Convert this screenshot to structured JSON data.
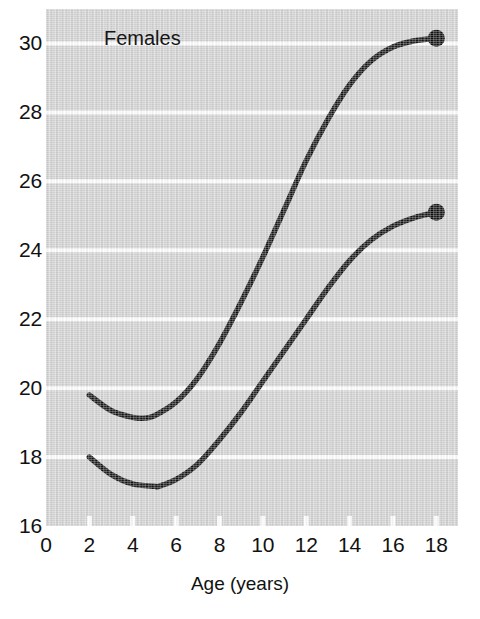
{
  "figure": {
    "panel_label": "Females",
    "background_color": "#d2d2d2",
    "gridline_color": "#ffffff",
    "curve_color": "#141414",
    "marker_color": "#101010"
  },
  "chart_data": {
    "type": "line",
    "title": "Females",
    "xlabel": "Age (years)",
    "ylabel": "",
    "xlim": [
      0,
      19
    ],
    "ylim": [
      16,
      31
    ],
    "xticks": [
      0,
      2,
      4,
      6,
      8,
      10,
      12,
      14,
      16,
      18
    ],
    "yticks": [
      16,
      18,
      20,
      22,
      24,
      26,
      28,
      30
    ],
    "xtick_labels": [
      "0",
      "2",
      "4",
      "6",
      "8",
      "10",
      "12",
      "14",
      "16",
      "18"
    ],
    "ytick_labels": [
      "16",
      "18",
      "20",
      "22",
      "24",
      "26",
      "28",
      "30"
    ],
    "grid": true,
    "grid_axis": "y",
    "legend": "none",
    "annotations": [
      "Females"
    ],
    "series": [
      {
        "name": "upper curve",
        "endpoint_marker": true,
        "endpoint": [
          18,
          30.15
        ],
        "x": [
          2,
          3,
          4,
          4.5,
          5,
          6,
          7,
          8,
          9,
          10,
          11,
          12,
          13,
          14,
          15,
          16,
          17,
          18
        ],
        "values": [
          19.8,
          19.35,
          19.15,
          19.13,
          19.2,
          19.6,
          20.3,
          21.3,
          22.5,
          23.8,
          25.2,
          26.6,
          27.8,
          28.8,
          29.5,
          29.9,
          30.08,
          30.15
        ]
      },
      {
        "name": "lower curve",
        "endpoint_marker": true,
        "endpoint": [
          18,
          25.1
        ],
        "x": [
          2,
          3,
          4,
          5,
          5.2,
          6,
          7,
          8,
          9,
          10,
          11,
          12,
          13,
          14,
          15,
          16,
          17,
          18
        ],
        "values": [
          18.0,
          17.5,
          17.22,
          17.15,
          17.15,
          17.35,
          17.8,
          18.5,
          19.3,
          20.2,
          21.1,
          22.0,
          22.9,
          23.7,
          24.3,
          24.7,
          24.95,
          25.1
        ]
      }
    ]
  },
  "axes": {
    "x_title": "Age (years)"
  }
}
